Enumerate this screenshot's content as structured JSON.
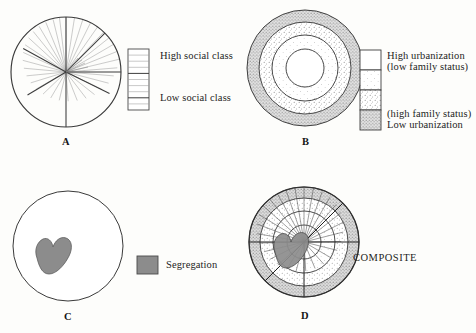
{
  "figure": {
    "type": "urban-structure-model-diagram",
    "panels": [
      {
        "id": "A",
        "letter": "A",
        "model": "sector",
        "description": "Circle divided into radial sectors representing social class sectors",
        "legend": {
          "top_label": "High social class",
          "bottom_label": "Low social class",
          "swatch": "striped-gradient-bar",
          "rows": 10
        }
      },
      {
        "id": "B",
        "letter": "B",
        "model": "zonal",
        "description": "Concentric zones representing urbanization / family status",
        "legend": {
          "labels": [
            "High urbanization",
            "(low family status)",
            "(high family status)",
            "Low urbanization"
          ],
          "cells": [
            "white",
            "light-stipple",
            "medium-stipple",
            "gray"
          ]
        }
      },
      {
        "id": "C",
        "letter": "C",
        "model": "segregation",
        "description": "Circle with a segregated ethnic-area blob",
        "legend": {
          "label": "Segregation",
          "swatch_color": "#8c8c8c"
        }
      },
      {
        "id": "D",
        "letter": "D",
        "model": "composite",
        "label": "COMPOSITE",
        "description": "Superimposition of sectors, zones and segregation"
      }
    ]
  },
  "colors": {
    "ink": "#1b1b1b",
    "line": "#555555",
    "light_line": "#a8a8a8",
    "blob": "#8c8c8c",
    "gray_ring": "#c9c9c9",
    "stipple": "#6e6e6e",
    "background": "#fdfdfb"
  }
}
